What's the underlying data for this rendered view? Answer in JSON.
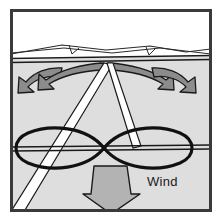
{
  "figure": {
    "name": "kite-wind-ridge-diagram",
    "frame": {
      "border_color": "#3a3a3a",
      "outer_background": "#ffffff"
    },
    "regions": {
      "sky": {
        "label": "sky",
        "color": "#ffffff"
      },
      "ground": {
        "label": "ground",
        "color": "#dedede"
      }
    },
    "horizon": {
      "label": "horizon-ridge-line",
      "color": "#1a1a1a"
    },
    "deflection_arrows": {
      "label": "air-deflection-arrows",
      "fill": "#8c8c8c",
      "stroke": "#1a1a1a",
      "count": 4,
      "directions": [
        "left-outer",
        "left-inner",
        "right-inner",
        "right-outer"
      ]
    },
    "flight_path": {
      "label": "figure-eight-flight-path",
      "shape": "lemniscate",
      "stroke": "#111111",
      "stroke_width": 3
    },
    "kite_lines": {
      "label": "kite-control-lines",
      "fill": "#ffffff",
      "stroke": "#1a1a1a",
      "count": 2
    },
    "wind_arrow": {
      "label": "wind-direction-arrow",
      "direction": "down",
      "fill": "#b3b3b3",
      "stroke": "#1a1a1a",
      "text": "Wind"
    }
  }
}
